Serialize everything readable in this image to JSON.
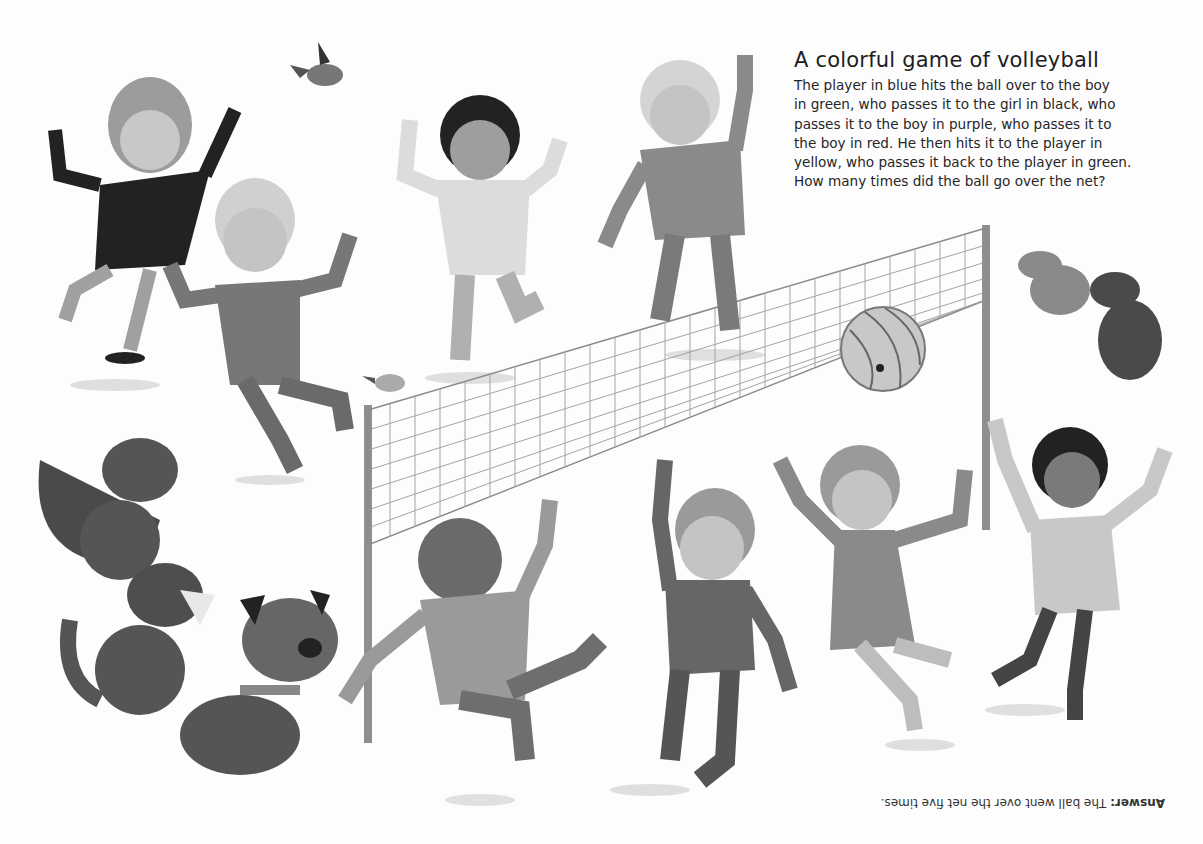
{
  "puzzle": {
    "title": "A colorful game of volleyball",
    "lines": [
      "The player in blue hits the ball over to the boy",
      "in green, who passes it to the girl in black, who",
      "passes it to the boy in purple, who passes it to",
      "the boy in red. He then hits it to the player in",
      "yellow, who passes it back to the player in green.",
      "How many times did the ball go over the net?"
    ]
  },
  "answer": {
    "label": "Answer:",
    "text": " The ball went over the net five times.",
    "orientation": "upside-down"
  },
  "illustration": {
    "scene": "children playing volleyball over a net",
    "players": [
      "girl in black",
      "boy in purple",
      "player in blue",
      "boy in green",
      "boy in red",
      "player in yellow",
      "girl in pink",
      "player in white"
    ],
    "animals": [
      "bird flying",
      "bird on net",
      "two dogs top-right",
      "fox",
      "spaniel",
      "bulldog"
    ],
    "objects": [
      "volleyball net",
      "volleyball"
    ],
    "palette": {
      "dark": "#2a2a2a",
      "mid": "#6e6e6e",
      "light": "#b4b4b4",
      "net": "#8a8a8a",
      "ground_shadow": "#d6d6d6"
    }
  }
}
